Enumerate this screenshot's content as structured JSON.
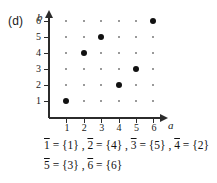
{
  "figure": {
    "part_label": "(d)",
    "x_axis_name": "a",
    "y_axis_name": "b",
    "x_ticks": [
      "1",
      "2",
      "3",
      "4",
      "5",
      "6"
    ],
    "y_ticks": [
      "6",
      "5",
      "4",
      "3",
      "2",
      "1"
    ]
  },
  "chart_data": {
    "type": "scatter",
    "title": "",
    "xlabel": "a",
    "ylabel": "b",
    "xlim": [
      0,
      7
    ],
    "ylim": [
      0,
      7
    ],
    "grid": true,
    "grid_style": "dotted-lattice",
    "x": [
      1,
      2,
      3,
      4,
      5,
      6
    ],
    "y": [
      1,
      4,
      5,
      2,
      3,
      6
    ],
    "points": [
      {
        "a": 1,
        "b": 1
      },
      {
        "a": 2,
        "b": 4
      },
      {
        "a": 3,
        "b": 5
      },
      {
        "a": 4,
        "b": 2
      },
      {
        "a": 5,
        "b": 3
      },
      {
        "a": 6,
        "b": 6
      }
    ],
    "xticks": [
      1,
      2,
      3,
      4,
      5,
      6
    ],
    "yticks": [
      1,
      2,
      3,
      4,
      5,
      6
    ],
    "legend": []
  },
  "equations": {
    "line1": [
      {
        "class": "1",
        "value": "{1}"
      },
      {
        "class": "2",
        "value": "{4}"
      },
      {
        "class": "3",
        "value": "{5}"
      },
      {
        "class": "4",
        "value": "{2}"
      }
    ],
    "line2": [
      {
        "class": "5",
        "value": "{3}"
      },
      {
        "class": "6",
        "value": "{6}"
      }
    ],
    "line1_text": "1 = {1} ,  2 = {4} ,  3 = {5} ,  4 = {2}",
    "line2_text": "5 = {3} ,  6 = {6}"
  }
}
